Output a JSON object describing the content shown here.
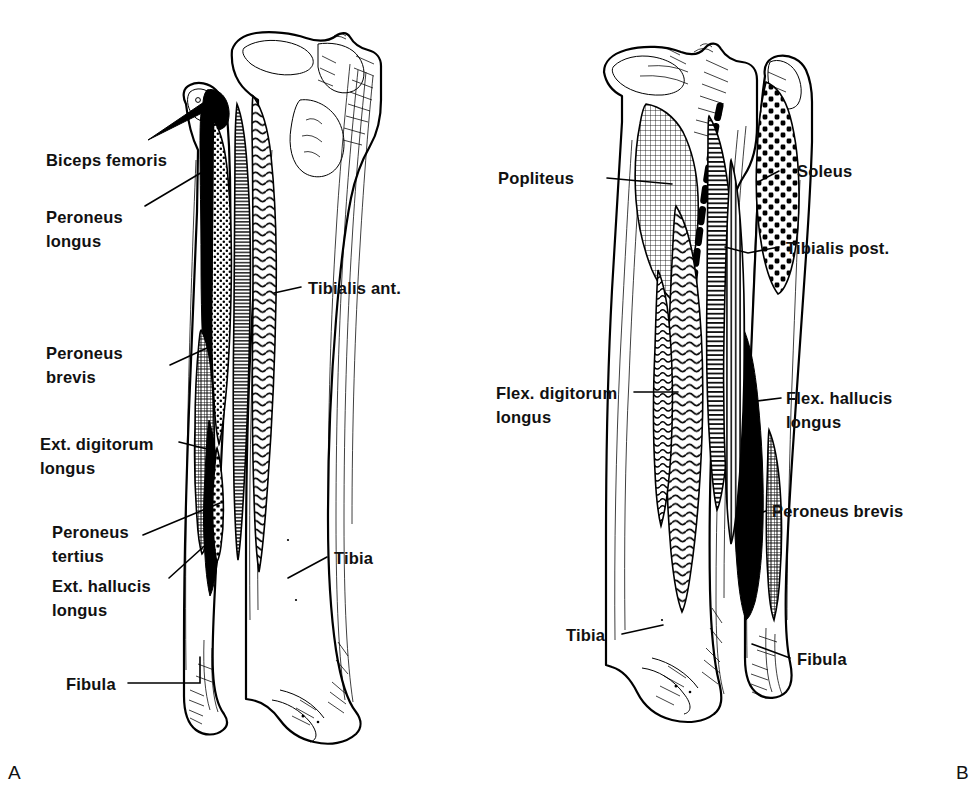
{
  "figure": {
    "panels": [
      {
        "id": "A",
        "view": "anterior",
        "id_label": "A",
        "labels": [
          {
            "key": "biceps_femoris",
            "text": "Biceps femoris",
            "lines": [
              "Biceps femoris"
            ]
          },
          {
            "key": "peroneus_longus",
            "text": "Peroneus longus",
            "lines": [
              "Peroneus",
              "longus"
            ]
          },
          {
            "key": "tibialis_ant",
            "text": "Tibialis ant.",
            "lines": [
              "Tibialis ant."
            ]
          },
          {
            "key": "peroneus_brevis",
            "text": "Peroneus brevis",
            "lines": [
              "Peroneus",
              "brevis"
            ]
          },
          {
            "key": "ext_dig_longus",
            "text": "Ext. digitorum longus",
            "lines": [
              "Ext. digitorum",
              "longus"
            ]
          },
          {
            "key": "peroneus_tertius",
            "text": "Peroneus tertius",
            "lines": [
              "Peroneus",
              "tertius"
            ]
          },
          {
            "key": "ext_hal_longus",
            "text": "Ext. hallucis longus",
            "lines": [
              "Ext. hallucis",
              "longus"
            ]
          },
          {
            "key": "tibia",
            "text": "Tibia",
            "lines": [
              "Tibia"
            ]
          },
          {
            "key": "fibula",
            "text": "Fibula",
            "lines": [
              "Fibula"
            ]
          }
        ]
      },
      {
        "id": "B",
        "view": "posterior",
        "id_label": "B",
        "labels": [
          {
            "key": "popliteus",
            "text": "Popliteus",
            "lines": [
              "Popliteus"
            ]
          },
          {
            "key": "soleus",
            "text": "Soleus",
            "lines": [
              "Soleus"
            ]
          },
          {
            "key": "tibialis_post",
            "text": "Tibialis post.",
            "lines": [
              "Tibialis post."
            ]
          },
          {
            "key": "flex_dig_longus",
            "text": "Flex. digitorum longus",
            "lines": [
              "Flex. digitorum",
              "longus"
            ]
          },
          {
            "key": "flex_hal_longus",
            "text": "Flex. hallucis longus",
            "lines": [
              "Flex. hallucis",
              "longus"
            ]
          },
          {
            "key": "peroneus_brevis",
            "text": "Peroneus brevis",
            "lines": [
              "Peroneus brevis"
            ]
          },
          {
            "key": "tibia",
            "text": "Tibia",
            "lines": [
              "Tibia"
            ]
          },
          {
            "key": "fibula",
            "text": "Fibula",
            "lines": [
              "Fibula"
            ]
          }
        ]
      }
    ]
  },
  "panelA": {
    "biceps_femoris_l1": "Biceps femoris",
    "peroneus_longus_l1": "Peroneus",
    "peroneus_longus_l2": "longus",
    "tibialis_ant_l1": "Tibialis ant.",
    "peroneus_brevis_l1": "Peroneus",
    "peroneus_brevis_l2": "brevis",
    "ext_dig_longus_l1": "Ext. digitorum",
    "ext_dig_longus_l2": "longus",
    "peroneus_tertius_l1": "Peroneus",
    "peroneus_tertius_l2": "tertius",
    "ext_hal_longus_l1": "Ext. hallucis",
    "ext_hal_longus_l2": "longus",
    "tibia_l1": "Tibia",
    "fibula_l1": "Fibula",
    "panel_id": "A"
  },
  "panelB": {
    "popliteus_l1": "Popliteus",
    "soleus_l1": "Soleus",
    "tibialis_post_l1": "Tibialis post.",
    "flex_dig_longus_l1": "Flex. digitorum",
    "flex_dig_longus_l2": "longus",
    "flex_hal_longus_l1": "Flex. hallucis",
    "flex_hal_longus_l2": "longus",
    "peroneus_brevis_l1": "Peroneus brevis",
    "tibia_l1": "Tibia",
    "fibula_l1": "Fibula",
    "panel_id": "B"
  },
  "colors": {
    "ink": "#111111",
    "line": "#000000",
    "background": "#ffffff"
  }
}
